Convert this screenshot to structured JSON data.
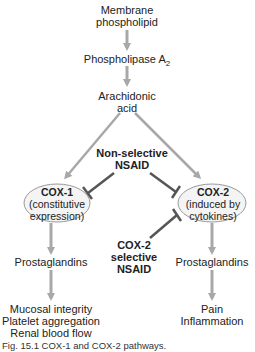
{
  "nodes": {
    "membrane": {
      "line1": "Membrane",
      "line2": "phospholipid"
    },
    "pla2": {
      "text": "Phospholipase A",
      "sub": "2"
    },
    "arachidonic": {
      "line1": "Arachidonic",
      "line2": "acid"
    },
    "cox1": {
      "title": "COX-1",
      "line1": "(constitutive",
      "line2": "expression)"
    },
    "cox2": {
      "title": "COX-2",
      "line1": "(induced by",
      "line2": "cytokines)"
    },
    "prost_left": {
      "text": "Prostaglandins"
    },
    "prost_right": {
      "text": "Prostaglandins"
    },
    "effects_left": {
      "line1": "Mucosal integrity",
      "line2": "Platelet aggregation",
      "line3": "Renal blood flow"
    },
    "effects_right": {
      "line1": "Pain",
      "line2": "Inflammation"
    }
  },
  "inhibitors": {
    "nonselective": {
      "line1": "Non-selective",
      "line2": "NSAID"
    },
    "cox2_selective": {
      "line1": "COX-2",
      "line2": "selective",
      "line3": "NSAID"
    }
  },
  "caption": "Fig. 15.1  COX-1 and COX-2 pathways.",
  "colors": {
    "arrow": "#a8a8a8",
    "inhibit": "#555555",
    "ellipse_fill": "#f4f4f4",
    "ellipse_stroke": "#9a9a9a"
  }
}
